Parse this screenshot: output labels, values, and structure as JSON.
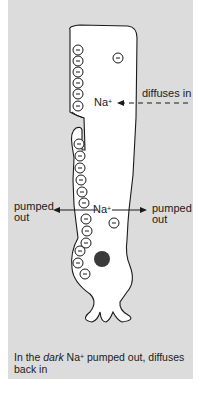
{
  "figure": {
    "background_color": "#dcdcdc",
    "cell_fill": "#ffffff",
    "outline_color": "#1a1a1a",
    "nucleus_color": "#3a3a3a",
    "labels": {
      "diffuses_in": "diffuses in",
      "na_top": "Na",
      "na_top_sup": "+",
      "na_mid": "Na",
      "na_mid_sup": "+",
      "pumped_out_left_1": "pumped",
      "pumped_out_left_2": "out",
      "pumped_out_right_1": "pumped",
      "pumped_out_right_2": "out"
    },
    "charge_symbol": "−",
    "caption": {
      "prefix": "In the ",
      "emphasis": "dark",
      "ion": " Na",
      "ion_sup": "+",
      "rest": " pumped out, diffuses back in"
    }
  }
}
